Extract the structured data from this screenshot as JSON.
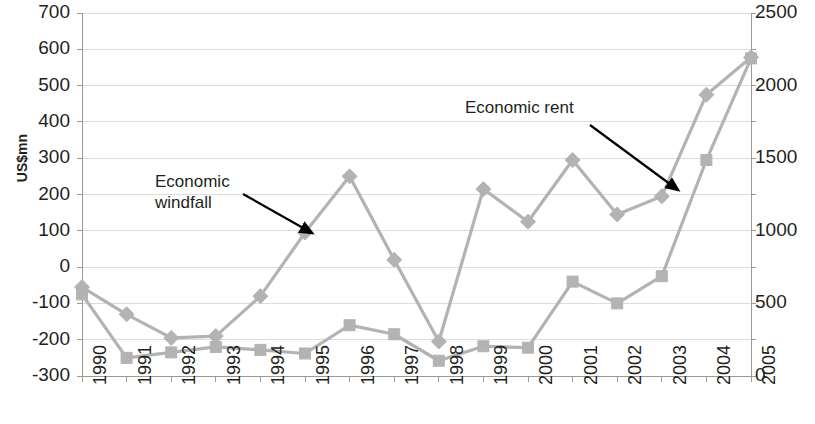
{
  "chart_data": {
    "type": "line",
    "title": "",
    "xlabel": "",
    "ylabel": "US$mn",
    "y2label": "",
    "categories": [
      "1990",
      "1991",
      "1992",
      "1993",
      "1994",
      "1995",
      "1996",
      "1997",
      "1998",
      "1999",
      "2000",
      "2001",
      "2002",
      "2003",
      "2004",
      "2005"
    ],
    "ylim": [
      -300,
      700
    ],
    "y2lim": [
      0,
      2500
    ],
    "ytick_labels": [
      "700",
      "600",
      "500",
      "400",
      "300",
      "200",
      "100",
      "0",
      "-100",
      "-200",
      "-300"
    ],
    "ytick_values": [
      700,
      600,
      500,
      400,
      300,
      200,
      100,
      0,
      -100,
      -200,
      -300
    ],
    "y2tick_labels": [
      "2500",
      "2000",
      "1500",
      "1000",
      "500",
      "0"
    ],
    "y2tick_values": [
      2500,
      2000,
      1500,
      1000,
      500,
      0
    ],
    "grid": true,
    "legend": "none",
    "series": [
      {
        "name": "Economic windfall",
        "marker": "diamond",
        "color": "#b3b3b3",
        "axis": "left",
        "values": [
          -55,
          -130,
          -195,
          -190,
          -80,
          95,
          250,
          20,
          -205,
          215,
          125,
          295,
          145,
          195,
          475,
          578
        ]
      },
      {
        "name": "Economic rent",
        "marker": "square",
        "color": "#b3b3b3",
        "axis": "left",
        "values": [
          -75,
          -250,
          -235,
          -220,
          -228,
          -238,
          -160,
          -185,
          -258,
          -218,
          -222,
          -40,
          -100,
          -25,
          295,
          575
        ]
      }
    ],
    "annotations": [
      {
        "id": "economic-windfall",
        "text": "Economic\nwindfall",
        "label_x": 155,
        "label_y": 172,
        "arrow_x1": 243,
        "arrow_y1": 194,
        "arrow_x2": 312,
        "arrow_y2": 233
      },
      {
        "id": "economic-rent",
        "text": "Economic rent",
        "label_x": 465,
        "label_y": 98,
        "arrow_x1": 590,
        "arrow_y1": 125,
        "arrow_x2": 678,
        "arrow_y2": 190
      }
    ],
    "colors": {
      "series_line": "#b3b3b3",
      "grid": "#dcdcdc",
      "axis": "#9a9a9a",
      "text": "#231f20",
      "annotation_arrow": "#000000"
    }
  }
}
